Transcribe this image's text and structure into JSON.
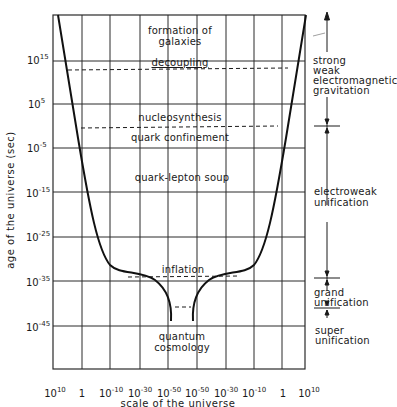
{
  "diagram": {
    "type": "cosmology-scale-vs-age",
    "y_axis": {
      "label": "age of the universe (sec)",
      "ticks": [
        {
          "base": "10",
          "exp": "15"
        },
        {
          "base": "10",
          "exp": "5"
        },
        {
          "base": "10",
          "exp": "-5"
        },
        {
          "base": "10",
          "exp": "-15"
        },
        {
          "base": "10",
          "exp": "-25"
        },
        {
          "base": "10",
          "exp": "-35"
        },
        {
          "base": "10",
          "exp": "-45"
        }
      ]
    },
    "x_axis": {
      "label": "scale of the universe",
      "ticks": [
        {
          "base": "10",
          "exp": "10"
        },
        {
          "base": "1",
          "exp": ""
        },
        {
          "base": "10",
          "exp": "-10"
        },
        {
          "base": "10",
          "exp": "-30"
        },
        {
          "base": "10",
          "exp": "-50"
        },
        {
          "base": "10",
          "exp": "-50"
        },
        {
          "base": "10",
          "exp": "-30"
        },
        {
          "base": "10",
          "exp": "-10"
        },
        {
          "base": "1",
          "exp": ""
        },
        {
          "base": "10",
          "exp": "10"
        }
      ]
    },
    "epochs": {
      "formation_line1": "formation of",
      "formation_line2": "galaxies",
      "decoupling": "decoupling",
      "nucleosynthesis": "nucleosynthesis",
      "quark_confinement": "quark confinement",
      "quark_lepton_soup": "quark-lepton soup",
      "inflation": "inflation",
      "quantum_line1": "quantum",
      "quantum_line2": "cosmology"
    },
    "forces": {
      "four_forces": [
        "strong",
        "weak",
        "electromagnetic",
        "gravitation"
      ],
      "electroweak_line1": "electroweak",
      "electroweak_line2": "unification",
      "grand_line1": "grand",
      "grand_line2": "unification",
      "super_line1": "super",
      "super_line2": "unification"
    },
    "colors": {
      "ink": "#1a1a1a",
      "grid": "#2a2a2a",
      "background": "#ffffff"
    }
  }
}
